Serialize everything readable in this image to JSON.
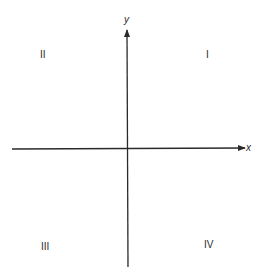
{
  "diagram": {
    "title": "",
    "type": "cartesian-plane-quadrants",
    "axes": {
      "x": {
        "label": "x",
        "start": [
          12,
          149
        ],
        "end": [
          245,
          148
        ],
        "color": "#2a2a2a"
      },
      "y": {
        "label": "y",
        "start": [
          128,
          267
        ],
        "end": [
          127,
          30
        ],
        "color": "#2a2a2a"
      }
    },
    "quadrants": [
      {
        "label": "I",
        "x": 206,
        "y": 50
      },
      {
        "label": "II",
        "x": 40,
        "y": 50
      },
      {
        "label": "III",
        "x": 42,
        "y": 242
      },
      {
        "label": "IV",
        "x": 204,
        "y": 240
      }
    ]
  }
}
